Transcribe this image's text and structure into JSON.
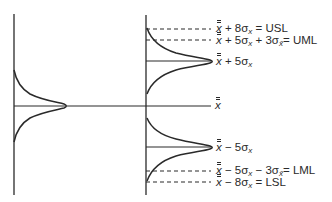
{
  "diagram": {
    "type": "control-limits-distribution-diagram",
    "colors": {
      "line": "#2a2a2a",
      "background": "#ffffff"
    },
    "center_line": {
      "label_symbol": "x̿",
      "y": 106
    },
    "left_distribution": {
      "peak_x": 67,
      "center_y": 106,
      "description": "process distribution of individual values"
    },
    "upper_distribution": {
      "peak_x": 212,
      "center_y": 61
    },
    "lower_distribution": {
      "peak_x": 212,
      "center_y": 147
    },
    "labels": {
      "usl": {
        "tail": "+ 8σ",
        "sub": "x",
        "suffix": " = USL"
      },
      "uml": {
        "tail": "+ 5σ",
        "sub": "x",
        "mid": " + 3σ",
        "sub2": "x̄",
        "suffix": "= UML"
      },
      "upper_mean": {
        "tail": "+ 5σ",
        "sub": "x"
      },
      "center": {
        "symbol": "x̿"
      },
      "lower_mean": {
        "tail": "− 5σ",
        "sub": "x"
      },
      "lml": {
        "tail": "− 5σ",
        "sub": "x",
        "mid": " − 3σ",
        "sub2": "x̄",
        "suffix": "= LML"
      },
      "lsl": {
        "tail": "− 8σ",
        "sub": "x",
        "suffix": " = LSL"
      }
    }
  }
}
